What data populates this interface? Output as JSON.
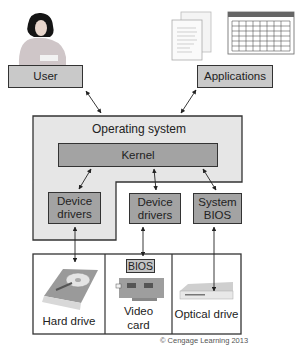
{
  "diagram": {
    "top": {
      "user": {
        "label": "User",
        "icon": "person-at-desk-icon"
      },
      "applications": {
        "label": "Applications",
        "icons": [
          "document-icon",
          "spreadsheet-icon"
        ]
      }
    },
    "os": {
      "label": "Operating system",
      "kernel": {
        "label": "Kernel"
      },
      "modules": [
        {
          "label_line1": "Device",
          "label_line2": "drivers",
          "inside_os": true
        },
        {
          "label_line1": "Device",
          "label_line2": "drivers",
          "inside_os": false
        },
        {
          "label_line1": "System",
          "label_line2": "BIOS",
          "inside_os": false
        }
      ]
    },
    "hardware": [
      {
        "label": "Hard drive",
        "icon": "hard-drive-icon"
      },
      {
        "label_line1": "Video",
        "label_line2": "card",
        "chip_label": "BIOS",
        "icon": "video-card-icon"
      },
      {
        "label": "Optical drive",
        "icon": "optical-drive-icon"
      }
    ],
    "copyright": "© Cengage Learning 2013",
    "colors": {
      "os_fill": "#e6e6e6",
      "box_fill": "#c9c9c9",
      "module_fill": "#a3a3a3",
      "border": "#333333"
    }
  }
}
